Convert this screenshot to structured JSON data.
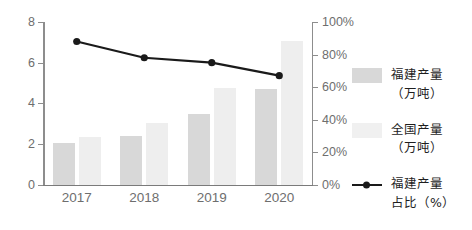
{
  "chart_data": {
    "type": "bar",
    "title": "",
    "subtitle": "",
    "xlabel": "",
    "ylabel": "",
    "categories": [
      "2017",
      "2018",
      "2019",
      "2020"
    ],
    "series": [
      {
        "name": "福建产量（万吨）",
        "type": "bar",
        "axis": "left",
        "color": "#d8d8d8",
        "values": [
          2.05,
          2.4,
          3.45,
          4.7
        ]
      },
      {
        "name": "全国产量（万吨）",
        "type": "bar",
        "axis": "left",
        "color": "#eeeeee",
        "values": [
          2.35,
          3.05,
          4.75,
          7.05
        ]
      },
      {
        "name": "福建产量占比（%）",
        "type": "line",
        "axis": "right",
        "color": "#1a1a1a",
        "values": [
          88,
          78,
          75,
          67
        ]
      }
    ],
    "left_axis": {
      "ylim": [
        0,
        8
      ],
      "ticks": [
        0,
        2,
        4,
        6,
        8
      ],
      "tick_labels": [
        "0",
        "2",
        "4",
        "6",
        "8"
      ]
    },
    "right_axis": {
      "ylim": [
        0,
        100
      ],
      "ticks": [
        0,
        20,
        40,
        60,
        80,
        100
      ],
      "tick_labels": [
        "0%",
        "20%",
        "40%",
        "60%",
        "80%",
        "100%"
      ]
    },
    "grid": false,
    "legend_position": "right"
  },
  "legend": {
    "items": [
      {
        "marker": "swatch-fujian",
        "line1": "福建产量",
        "line2": "（万吨）"
      },
      {
        "marker": "swatch-national",
        "line1": "全国产量",
        "line2": "（万吨）"
      },
      {
        "marker": "line-marker",
        "line1": "福建产量",
        "line2": "占比（%）"
      }
    ]
  }
}
